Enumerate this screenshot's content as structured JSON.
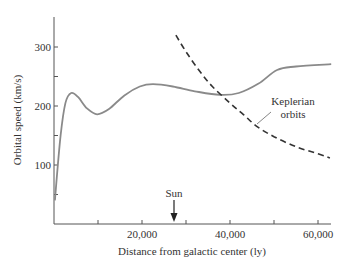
{
  "chart_data": {
    "type": "line",
    "title": "",
    "xlabel": "Distance from galactic center (ly)",
    "ylabel": "Orbital speed (km/s)",
    "xlim": [
      0,
      63000
    ],
    "ylim": [
      0,
      350
    ],
    "x_ticks": [
      10000,
      20000,
      30000,
      40000,
      50000,
      60000
    ],
    "x_tick_labels": [
      {
        "value": 20000,
        "label": "20,000"
      },
      {
        "value": 40000,
        "label": "40,000"
      },
      {
        "value": 60000,
        "label": "60,000"
      }
    ],
    "y_ticks": [
      50,
      100,
      150,
      200,
      250,
      300
    ],
    "y_tick_labels": [
      {
        "value": 100,
        "label": "100"
      },
      {
        "value": 200,
        "label": "200"
      },
      {
        "value": 300,
        "label": "300"
      }
    ],
    "grid": false,
    "series": [
      {
        "name": "Observed rotation curve",
        "style": "solid",
        "color": "#8a8a8a",
        "points": [
          [
            200,
            40
          ],
          [
            1500,
            150
          ],
          [
            2600,
            205
          ],
          [
            3900,
            222
          ],
          [
            5500,
            215
          ],
          [
            7500,
            196
          ],
          [
            9800,
            186
          ],
          [
            12500,
            195
          ],
          [
            16000,
            218
          ],
          [
            19500,
            233
          ],
          [
            22500,
            237
          ],
          [
            27000,
            233
          ],
          [
            32000,
            225
          ],
          [
            37700,
            219
          ],
          [
            42000,
            222
          ],
          [
            46500,
            238
          ],
          [
            50700,
            261
          ],
          [
            55000,
            267
          ],
          [
            63000,
            271
          ]
        ]
      },
      {
        "name": "Keplerian orbits",
        "style": "dashed",
        "color": "#333333",
        "points": [
          [
            27700,
            320
          ],
          [
            30000,
            292
          ],
          [
            33000,
            260
          ],
          [
            36000,
            233
          ],
          [
            40000,
            205
          ],
          [
            43000,
            186
          ],
          [
            46000,
            166
          ],
          [
            50000,
            148
          ],
          [
            55000,
            131
          ],
          [
            60000,
            119
          ],
          [
            62700,
            112
          ]
        ]
      }
    ],
    "annotations": [
      {
        "text_lines": [
          "Keplerian",
          "orbits"
        ],
        "points_to_series": "Keplerian orbits",
        "at_x": 46000
      },
      {
        "text": "Sun",
        "arrow_to_x": 27000
      }
    ]
  }
}
